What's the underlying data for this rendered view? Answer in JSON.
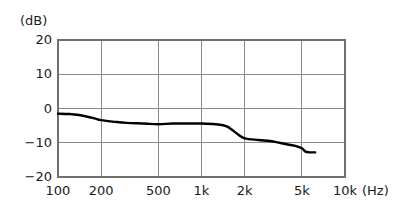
{
  "chart_data": {
    "type": "line",
    "title": "",
    "xlabel": "(Hz)",
    "ylabel": "(dB)",
    "xscale": "log",
    "xlim": [
      100,
      10000
    ],
    "ylim": [
      -20,
      20
    ],
    "grid": true,
    "legend": "none",
    "x_ticks": [
      {
        "value": 100,
        "label": "100"
      },
      {
        "value": 200,
        "label": "200"
      },
      {
        "value": 500,
        "label": "500"
      },
      {
        "value": 1000,
        "label": "1k"
      },
      {
        "value": 2000,
        "label": "2k"
      },
      {
        "value": 5000,
        "label": "5k"
      },
      {
        "value": 10000,
        "label": "10k"
      }
    ],
    "y_ticks": [
      {
        "value": 20,
        "label": "20"
      },
      {
        "value": 10,
        "label": "10"
      },
      {
        "value": 0,
        "label": "0"
      },
      {
        "value": -10,
        "label": "−10"
      },
      {
        "value": -20,
        "label": "−20"
      }
    ],
    "series": [
      {
        "name": "frequency-response",
        "color": "#000000",
        "x": [
          100,
          120,
          140,
          160,
          180,
          200,
          250,
          300,
          400,
          500,
          630,
          800,
          1000,
          1250,
          1500,
          1800,
          2000,
          2500,
          3000,
          3500,
          4000,
          4500,
          5000,
          5300,
          5700,
          6200
        ],
        "y": [
          -1.5,
          -1.6,
          -1.9,
          -2.4,
          -2.9,
          -3.4,
          -3.9,
          -4.2,
          -4.4,
          -4.6,
          -4.4,
          -4.4,
          -4.4,
          -4.6,
          -5.2,
          -7.6,
          -8.7,
          -9.2,
          -9.5,
          -10.0,
          -10.5,
          -10.9,
          -11.6,
          -12.6,
          -12.8,
          -12.8
        ]
      }
    ]
  },
  "axis_unit_y": "(dB)",
  "axis_unit_x": "(Hz)",
  "plot_geometry": {
    "left": 58,
    "right": 345,
    "top": 40,
    "bottom": 177,
    "grid_color": "#8a8a8a",
    "frame_color": "#6f6f6f",
    "curve_color": "#151515",
    "curve_width": 2.4,
    "background": "#ffffff"
  }
}
